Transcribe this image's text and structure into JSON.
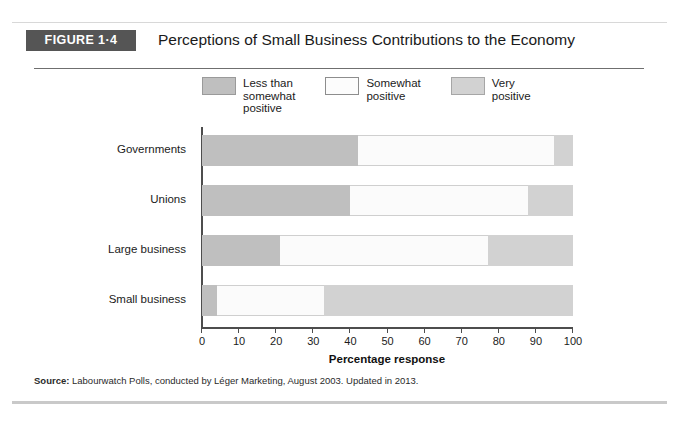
{
  "figure": {
    "tag": "FIGURE 1·4",
    "title": "Perceptions of Small Business Contributions to the Economy",
    "source_label": "Source:",
    "source_text": " Labourwatch Polls, conducted by Léger Marketing, August 2003. Updated in 2013."
  },
  "colors": {
    "tag_background": "#555555",
    "less_than_somewhat_positive": "#bfbfbf",
    "somewhat_positive": "#fbfbfb",
    "very_positive": "#d2d2d2",
    "axis": "#4d4d4d"
  },
  "chart_data": {
    "type": "bar",
    "orientation": "horizontal",
    "stacked": true,
    "title": "Perceptions of Small Business Contributions to the Economy",
    "xlabel": "Percentage response",
    "ylabel": "",
    "xlim": [
      0,
      100
    ],
    "xticks": [
      0,
      10,
      20,
      30,
      40,
      50,
      60,
      70,
      80,
      90,
      100
    ],
    "xticklabels": [
      "0",
      "10",
      "20",
      "30",
      "40",
      "50",
      "60",
      "70",
      "80",
      "90",
      "100"
    ],
    "grid": false,
    "legend_position": "top",
    "categories": [
      "Governments",
      "Unions",
      "Large business",
      "Small business"
    ],
    "series": [
      {
        "name": "Less than\nsomewhat\npositive",
        "values": [
          42,
          40,
          21,
          4
        ]
      },
      {
        "name": "Somewhat\npositive",
        "values": [
          53,
          48,
          56,
          29
        ]
      },
      {
        "name": "Very\npositive",
        "values": [
          5,
          12,
          23,
          67
        ]
      }
    ]
  }
}
